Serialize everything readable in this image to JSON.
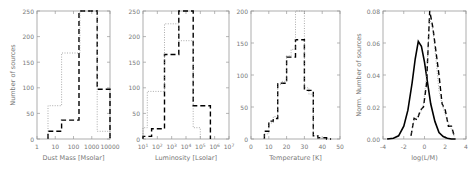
{
  "figure": {
    "panels": 4,
    "line_color": "#000000",
    "axis_color": "#999999",
    "text_color": "#777777"
  },
  "chart_data": [
    {
      "type": "bar",
      "style": "step-histogram",
      "title": "",
      "xlabel": "Dust Mass [Msolar]",
      "ylabel": "Number of sources",
      "xscale": "log",
      "xlim": [
        1,
        10000
      ],
      "ylim": [
        0,
        250
      ],
      "xticks": [
        "1",
        "10",
        "100",
        "1000",
        "10000"
      ],
      "yticks": [
        "0",
        "50",
        "100",
        "150",
        "200",
        "250"
      ],
      "series": [
        {
          "name": "dashed",
          "linestyle": "dashed",
          "bin_edges_log10": [
            0.6,
            1.35,
            2.3,
            3.3,
            4.0
          ],
          "values": [
            15,
            37,
            250,
            97
          ]
        },
        {
          "name": "dotted",
          "linestyle": "dotted",
          "bin_edges_log10": [
            0.6,
            1.35,
            2.35,
            3.3,
            4.0
          ],
          "values": [
            65,
            168,
            250,
            15
          ]
        }
      ]
    },
    {
      "type": "bar",
      "style": "step-histogram",
      "title": "",
      "xlabel": "Luminosity [Lsolar]",
      "ylabel": "",
      "xscale": "log",
      "xlim": [
        10,
        10000000
      ],
      "ylim": [
        0,
        250
      ],
      "xticks": [
        "10^1",
        "10^2",
        "10^3",
        "10^4",
        "10^5",
        "10^6",
        "10^7"
      ],
      "yticks": [
        "0",
        "50",
        "100",
        "150",
        "200",
        "250"
      ],
      "series": [
        {
          "name": "dashed",
          "linestyle": "dashed",
          "bin_edges_log10": [
            1.0,
            1.6,
            2.5,
            3.5,
            4.5,
            5.7
          ],
          "values": [
            5,
            20,
            165,
            250,
            65
          ]
        },
        {
          "name": "dotted",
          "linestyle": "dotted",
          "bin_edges_log10": [
            1.0,
            1.3,
            2.5,
            3.5,
            4.5,
            5.0
          ],
          "values": [
            22,
            93,
            225,
            192,
            22
          ]
        }
      ]
    },
    {
      "type": "bar",
      "style": "step-histogram",
      "title": "",
      "xlabel": "Temperature [K]",
      "ylabel": "",
      "xlim": [
        0,
        50
      ],
      "ylim": [
        0,
        200
      ],
      "xticks": [
        "0",
        "10",
        "20",
        "30",
        "40",
        "50"
      ],
      "yticks": [
        "0",
        "50",
        "100",
        "150",
        "200"
      ],
      "series": [
        {
          "name": "dashed",
          "linestyle": "dashed",
          "bin_edges": [
            7.5,
            10,
            12.5,
            15,
            17.5,
            20,
            22.5,
            25,
            27.5,
            30,
            32.5,
            35,
            37.5,
            40,
            42.5,
            45
          ],
          "values": [
            12,
            28,
            32,
            87,
            87,
            128,
            128,
            155,
            155,
            76,
            76,
            5,
            2,
            2,
            0
          ]
        },
        {
          "name": "dotted",
          "linestyle": "dotted",
          "bin_edges": [
            7.5,
            10,
            12.5,
            15,
            17.5,
            20,
            22.5,
            25,
            27.5,
            30,
            32.5,
            35,
            37.5,
            40
          ],
          "values": [
            8,
            25,
            35,
            85,
            90,
            130,
            140,
            200,
            200,
            80,
            70,
            5,
            1
          ]
        }
      ]
    },
    {
      "type": "line",
      "title": "",
      "xlabel": "log(L/M)",
      "ylabel": "Norm. Number of sources",
      "xlim": [
        -4,
        4
      ],
      "ylim": [
        0,
        0.08
      ],
      "xticks": [
        "-4",
        "-2",
        "0",
        "2",
        "4"
      ],
      "yticks": [
        "0.00",
        "0.02",
        "0.04",
        "0.06",
        "0.08"
      ],
      "series": [
        {
          "name": "solid-gaussian",
          "linestyle": "solid",
          "x": [
            -3.6,
            -3.0,
            -2.5,
            -2.0,
            -1.6,
            -1.2,
            -0.9,
            -0.6,
            -0.3,
            0.0,
            0.3,
            0.6,
            1.0,
            1.4,
            1.8,
            2.2,
            2.6,
            3.0
          ],
          "y": [
            0.0,
            0.0005,
            0.002,
            0.008,
            0.018,
            0.035,
            0.05,
            0.061,
            0.058,
            0.048,
            0.035,
            0.022,
            0.011,
            0.004,
            0.0015,
            0.0005,
            0.0,
            0.0
          ]
        },
        {
          "name": "dashed-histogram",
          "linestyle": "dashed",
          "x": [
            -1.3,
            -1.0,
            -0.7,
            -0.4,
            -0.1,
            0.2,
            0.5,
            0.8,
            1.1,
            1.4,
            1.7,
            2.0,
            2.3,
            2.6,
            2.9
          ],
          "y": [
            0.002,
            0.013,
            0.012,
            0.018,
            0.02,
            0.035,
            0.08,
            0.07,
            0.055,
            0.04,
            0.022,
            0.018,
            0.008,
            0.008,
            0.001
          ]
        },
        {
          "name": "dotted-histogram",
          "linestyle": "dotted",
          "x": [
            -1.3,
            -1.0,
            -0.7,
            -0.4,
            -0.1,
            0.2,
            0.5,
            0.8,
            1.1,
            1.4,
            1.7,
            2.0,
            2.3,
            2.6,
            2.9
          ],
          "y": [
            0.002,
            0.012,
            0.014,
            0.016,
            0.022,
            0.04,
            0.075,
            0.068,
            0.05,
            0.03,
            0.022,
            0.015,
            0.01,
            0.006,
            0.001
          ]
        }
      ]
    }
  ]
}
